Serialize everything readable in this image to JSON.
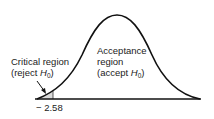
{
  "diagram": {
    "type": "normal-distribution-one-tailed-test",
    "critical_region": {
      "line1": "Critical region",
      "line2_prefix": "(reject ",
      "h": "H",
      "sub": "0",
      "suffix": ")"
    },
    "acceptance_region": {
      "line1": "Acceptance",
      "line2": "region",
      "line3_prefix": "(accept ",
      "h": "H",
      "sub": "0",
      "suffix": ")"
    },
    "critical_value": "− 2.58",
    "colors": {
      "curve": "#111111",
      "shade": "#d9d9d9"
    }
  }
}
